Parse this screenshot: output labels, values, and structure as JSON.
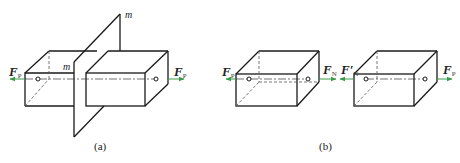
{
  "figure_a": {
    "caption": "(a)",
    "plane_label_top": "m",
    "plane_label_left": "m",
    "force_left": {
      "symbol": "F",
      "subscript": "P"
    },
    "force_right": {
      "symbol": "F",
      "subscript": "P"
    }
  },
  "figure_b": {
    "caption": "(b)",
    "box1_force_left": {
      "symbol": "F",
      "subscript": "P"
    },
    "box1_force_right": {
      "symbol": "F",
      "subscript": "N"
    },
    "box2_force_left": {
      "symbol": "F′",
      "subscript": "N"
    },
    "box2_force_right": {
      "symbol": "F",
      "subscript": "P"
    }
  },
  "colors": {
    "line": "#1a1a1a",
    "arrow": "#3a9a4a",
    "dashed": "#555555"
  }
}
